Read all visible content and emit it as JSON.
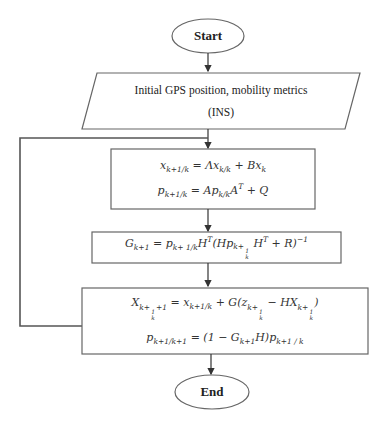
{
  "diagram": {
    "type": "flowchart",
    "nodes": {
      "start": {
        "shape": "ellipse",
        "label": "Start"
      },
      "input": {
        "shape": "parallelogram",
        "line1": "Initial GPS position, mobility metrics",
        "line2": "(INS)"
      },
      "predict": {
        "shape": "rectangle",
        "eq1": {
          "lhs": "x",
          "lhs_sub": "k+1/k",
          "rhs": " = Λx",
          "rhs_sub": "k/k",
          "tail": " + Bx",
          "tail_sub": "k"
        },
        "eq2": {
          "lhs": "p",
          "lhs_sub": "k+1/k",
          "rhs": " = Ap",
          "rhs_sub": "k/k",
          "mid": "A",
          "mid_sup": "T",
          "tail": " + Q"
        }
      },
      "gain": {
        "shape": "rectangle",
        "eq": {
          "lhs": "G",
          "lhs_sub": "k+1",
          "p1": " = p",
          "p1_sub": "k+ 1/k",
          "h1": "H",
          "h1_sup": "T",
          "open": "(Hp",
          "frac_num": "1",
          "frac_den": "k",
          "k_plus": "k+",
          "h2": " H",
          "h2_sup": "T",
          "close": " + R)",
          "exp": "−1"
        }
      },
      "update": {
        "shape": "rectangle",
        "eq1": {
          "lhs": "X",
          "k_plus": "k+",
          "frac_num": "1",
          "frac_den": "k",
          "plus1": "+1",
          "eqx": " = x",
          "eqx_sub": "k+1/k",
          "g": " + G(z",
          "minus": " − HX",
          "close": ")"
        },
        "eq2": {
          "lhs": "p",
          "lhs_sub": "k+1/k+1",
          "mid": " = (1 − G",
          "mid_sub": "k+1",
          "tail": "H)p",
          "tail_sub": "k+1 / k"
        }
      },
      "end": {
        "shape": "ellipse",
        "label": "End"
      }
    },
    "edges": [
      {
        "from": "start",
        "to": "input"
      },
      {
        "from": "input",
        "to": "predict"
      },
      {
        "from": "predict",
        "to": "gain"
      },
      {
        "from": "gain",
        "to": "update"
      },
      {
        "from": "update",
        "to": "end"
      },
      {
        "from": "update",
        "to": "predict",
        "type": "loop-back"
      }
    ],
    "colors": {
      "stroke": "#555555",
      "text": "#222222",
      "background": "#ffffff"
    }
  }
}
